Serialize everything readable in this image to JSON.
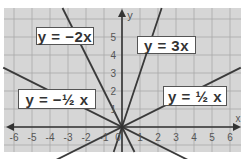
{
  "chart_data": {
    "type": "line",
    "title": "",
    "xlabel": "x",
    "ylabel": "y",
    "xlim": [
      -6.5,
      6.5
    ],
    "ylim": [
      -1.4,
      6.5
    ],
    "grid": true,
    "x_ticks": [
      -6,
      -5,
      -4,
      -3,
      -2,
      -1,
      0,
      1,
      2,
      3,
      4,
      5,
      6
    ],
    "x_tick_labels": [
      "-6",
      "-5",
      "-4",
      "-3",
      "-2",
      "-1",
      "0",
      "1",
      "2",
      "3",
      "4",
      "5",
      "6"
    ],
    "y_ticks": [
      1,
      2,
      3,
      4,
      5
    ],
    "y_tick_labels": [
      "1",
      "2",
      "3",
      "4",
      "5"
    ],
    "series": [
      {
        "name": "y = -2x",
        "slope": -2,
        "label": "y = −2x"
      },
      {
        "name": "y = 3x",
        "slope": 3,
        "label": "y = 3x"
      },
      {
        "name": "y = -1/2 x",
        "slope": -0.5,
        "label": "y = −½ x"
      },
      {
        "name": "y = 1/2 x",
        "slope": 0.5,
        "label": "y = ½ x"
      }
    ],
    "legend_position": "inline labels"
  },
  "labels": {
    "neg2x": "y = −2x",
    "pos3x": "y = 3x",
    "neghalfx": "y = −½ x",
    "poshalfx": "y = ½ x"
  },
  "axes": {
    "x_name": "x",
    "y_name": "y"
  },
  "colors": {
    "background": "#d6d6d6",
    "grid": "#a9a9a9",
    "axis": "#333333",
    "line": "#3a3a3a",
    "label_box": "#ffffff"
  }
}
